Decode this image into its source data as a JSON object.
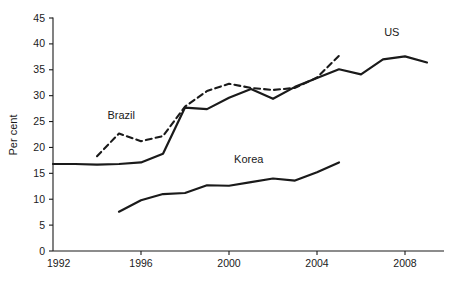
{
  "chart_data": {
    "type": "line",
    "title": "",
    "subtitle": "",
    "xlabel": "",
    "ylabel": "Per cent",
    "xlim": [
      1992,
      2009.5
    ],
    "ylim": [
      0,
      45
    ],
    "grid": false,
    "legend_position": "inline-annotations",
    "x_ticks": [
      "1992",
      "1996",
      "2000",
      "2004",
      "2008"
    ],
    "x_tick_values": [
      1992,
      1996,
      2000,
      2004,
      2008
    ],
    "y_ticks": [
      "0",
      "5",
      "10",
      "15",
      "20",
      "25",
      "30",
      "35",
      "40",
      "45"
    ],
    "y_tick_values": [
      0,
      5,
      10,
      15,
      20,
      25,
      30,
      35,
      40,
      45
    ],
    "series": [
      {
        "name": "US",
        "style": "solid",
        "color": "#1a1a1a",
        "label_position": {
          "x": 2007.4,
          "y": 41.6
        },
        "x": [
          1992,
          1993,
          1994,
          1995,
          1996,
          1997,
          1998,
          1999,
          2000,
          2001,
          2002,
          2003,
          2004,
          2005,
          2006,
          2007,
          2008,
          2009
        ],
        "values": [
          16.8,
          16.8,
          16.7,
          16.8,
          17.1,
          18.8,
          27.7,
          27.4,
          29.6,
          31.3,
          29.4,
          31.7,
          33.4,
          35.1,
          34.1,
          37.0,
          37.6,
          36.4
        ]
      },
      {
        "name": "Brazil",
        "style": "dashed",
        "color": "#1a1a1a",
        "label_position": {
          "x": 1995.1,
          "y": 25.4
        },
        "x": [
          1994,
          1995,
          1996,
          1997,
          1998,
          1999,
          2000,
          2001,
          2002,
          2003,
          2004,
          2005
        ],
        "values": [
          18.3,
          22.7,
          21.2,
          22.2,
          27.9,
          30.9,
          32.3,
          31.5,
          31.1,
          31.5,
          33.5,
          37.7
        ]
      },
      {
        "name": "Korea",
        "style": "solid",
        "color": "#1a1a1a",
        "label_position": {
          "x": 2000.9,
          "y": 17.0
        },
        "x": [
          1995,
          1996,
          1997,
          1998,
          1999,
          2000,
          2001,
          2002,
          2003,
          2004,
          2005
        ],
        "values": [
          7.6,
          9.8,
          11.0,
          11.2,
          12.7,
          12.6,
          13.3,
          14.0,
          13.6,
          15.2,
          17.1
        ]
      }
    ]
  },
  "annotations": {
    "us": "US",
    "brazil": "Brazil",
    "korea": "Korea"
  }
}
